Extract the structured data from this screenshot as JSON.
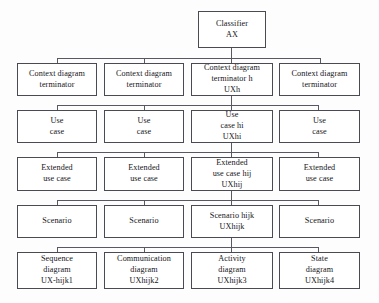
{
  "diagram": {
    "line_color": "#585860",
    "box_border_color": "#4a4a52",
    "background": "#ffffff",
    "root": {
      "lines": [
        "Classifier",
        "AX"
      ]
    },
    "rows": [
      {
        "name": "context-diagram-terminator-row",
        "nodes": [
          {
            "lines": [
              "Context diagram",
              "terminator"
            ]
          },
          {
            "lines": [
              "Context diagram",
              "terminator"
            ]
          },
          {
            "lines": [
              "Context diagram",
              "terminator h",
              "UXh"
            ]
          },
          {
            "lines": [
              "Context diagram",
              "terminator"
            ]
          }
        ]
      },
      {
        "name": "use-case-row",
        "nodes": [
          {
            "lines": [
              "Use",
              "case"
            ]
          },
          {
            "lines": [
              "Use",
              "case"
            ]
          },
          {
            "lines": [
              "Use",
              "case hi",
              "UXhi"
            ]
          },
          {
            "lines": [
              "Use",
              "case"
            ]
          }
        ]
      },
      {
        "name": "extended-use-case-row",
        "nodes": [
          {
            "lines": [
              "Extended",
              "use case"
            ]
          },
          {
            "lines": [
              "Extended",
              "use case"
            ]
          },
          {
            "lines": [
              "Extended",
              "use case hij",
              "UXhij"
            ]
          },
          {
            "lines": [
              "Extended",
              "use case"
            ]
          }
        ]
      },
      {
        "name": "scenario-row",
        "nodes": [
          {
            "lines": [
              "Scenario"
            ]
          },
          {
            "lines": [
              "Scenario"
            ]
          },
          {
            "lines": [
              "Scenario hijk",
              "UXhijk"
            ]
          },
          {
            "lines": [
              "Scenario"
            ]
          }
        ]
      },
      {
        "name": "diagram-row",
        "nodes": [
          {
            "lines": [
              "Sequence",
              "diagram",
              "UX-hijk1"
            ]
          },
          {
            "lines": [
              "Communication",
              "diagram",
              "UXhijk2"
            ]
          },
          {
            "lines": [
              "Activity",
              "diagram",
              "UXhijk3"
            ]
          },
          {
            "lines": [
              "State",
              "diagram",
              "UXhijk4"
            ]
          }
        ]
      }
    ]
  }
}
